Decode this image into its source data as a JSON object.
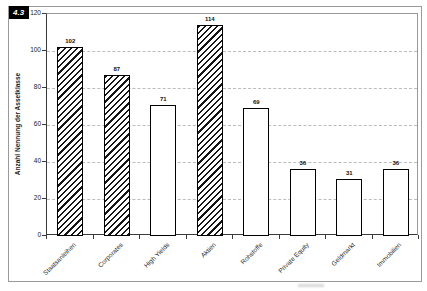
{
  "figure_label": "4.3",
  "chart_data": {
    "type": "bar",
    "title": "",
    "xlabel": "",
    "ylabel": "Anzahl Nennung der Assetklasse",
    "ylim": [
      0,
      120
    ],
    "yticks": [
      0,
      20,
      40,
      60,
      80,
      100,
      120
    ],
    "gridlines": {
      "style": "dashed",
      "orientation": "horizontal",
      "at": [
        20,
        40,
        60,
        80,
        100
      ]
    },
    "legend": "none",
    "categories": [
      "Staatsanleihen",
      "Corporates",
      "High Yields",
      "Aktien",
      "Rohstoffe",
      "Private Equity",
      "Geldmarkt",
      "Immobilien"
    ],
    "values": [
      102,
      87,
      71,
      114,
      69,
      36,
      31,
      36
    ],
    "bar_fill": [
      "hatched",
      "hatched",
      "plain",
      "hatched",
      "plain",
      "plain",
      "plain",
      "plain"
    ],
    "colors": {
      "bar_outline": "#000000",
      "hatch": "#161616",
      "plain_fill": "#ffffff",
      "grid": "#bcbcbc",
      "frame": "#9a9a9a",
      "axis": "#3a3a3a",
      "badge_bg": "#000000",
      "badge_text": "#ffffff"
    }
  }
}
